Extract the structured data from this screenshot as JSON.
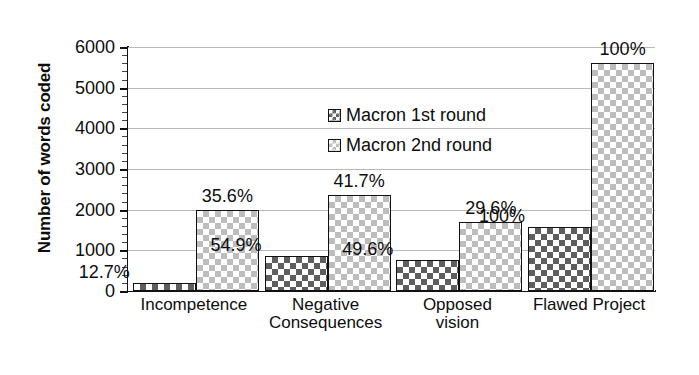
{
  "chart_data": {
    "type": "bar",
    "title": "",
    "xlabel": "",
    "ylabel": "Number of words coded",
    "ylim": [
      0,
      6000
    ],
    "ytick_labels": [
      "0",
      "1000",
      "2000",
      "3000",
      "4000",
      "5000",
      "6000"
    ],
    "ytick_values": [
      0,
      1000,
      2000,
      3000,
      4000,
      5000,
      6000
    ],
    "y_minor_tick_interval": 200,
    "grid": true,
    "grid_axis": "y",
    "legend_position": "inside top-left",
    "categories": [
      "Incompetence",
      "Negative Consequences",
      "Opposed vision",
      "Flawed Project"
    ],
    "category_lines": [
      [
        "Incompetence"
      ],
      [
        "Negative",
        "Consequences"
      ],
      [
        "Opposed",
        "vision"
      ],
      [
        "Flawed Project"
      ]
    ],
    "series": [
      {
        "name": "Macron 1st round",
        "pattern": "dark-checkerboard",
        "color": "#5e5e5e",
        "values": [
          200,
          870,
          770,
          1570
        ],
        "labels": [
          "12.7%",
          "54.9%",
          "49.6%",
          "100%"
        ]
      },
      {
        "name": "Macron 2nd round",
        "pattern": "light-checkerboard",
        "color": "#bdbdbd",
        "values": [
          2000,
          2350,
          1700,
          5610
        ],
        "labels": [
          "35.6%",
          "41.7%",
          "29.6%",
          "100%"
        ]
      }
    ]
  },
  "legend": {
    "items": [
      {
        "label": "Macron 1st round"
      },
      {
        "label": "Macron 2nd round"
      }
    ]
  },
  "axis": {
    "y_title": "Number of words coded"
  },
  "colors": {
    "series1": "#5e5e5e",
    "series2": "#bdbdbd",
    "axis": "#111111",
    "grid": "#b9b9b9",
    "background": "#ffffff"
  }
}
